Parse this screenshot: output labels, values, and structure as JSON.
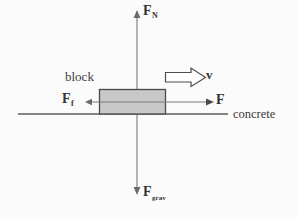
{
  "diagram": {
    "background_color": "#fbfbfb",
    "stroke_color": "#595959",
    "block_fill_color": "#c8c8c8",
    "block_stroke_color": "#4a4a4a",
    "text_color": "#3a3a3a"
  },
  "labels": {
    "normal_force": "F",
    "normal_force_sub": "N",
    "gravity_force": "F",
    "gravity_force_sub": "grav",
    "friction_force": "F",
    "friction_force_sub": "f",
    "applied_force": "F",
    "velocity": "v",
    "block": "block",
    "surface": "concrete"
  },
  "geometry": {
    "block": {
      "x": 99,
      "y": 89,
      "width": 67,
      "height": 25
    },
    "ground_line": {
      "x1": 18,
      "y1": 114,
      "x2": 228,
      "y2": 114
    },
    "vertical_axis": {
      "x": 137,
      "y_top": 12,
      "y_bottom": 192
    },
    "horizontal_axis": {
      "y": 102,
      "x_left": 86,
      "x_right": 213
    },
    "velocity_arrow": {
      "x": 165,
      "y": 71,
      "width": 42,
      "height": 13
    }
  }
}
